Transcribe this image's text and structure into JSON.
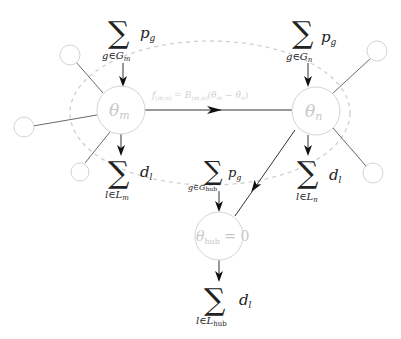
{
  "diagram": {
    "type": "power-network-dc-flow",
    "nodes": {
      "m": {
        "label_base": "θ",
        "label_sub": "m"
      },
      "n": {
        "label_base": "θ",
        "label_sub": "n"
      },
      "hub": {
        "label": "θ",
        "label_sub": "hub",
        "label_suffix": " = 0"
      }
    },
    "edge_mn": {
      "flow_label": "f(m,n) = B(m,n)(θm − θn)",
      "parts": {
        "f": "f",
        "f_sub": "(m,n)",
        "eq": " = ",
        "B": "B",
        "B_sub": "(m,n)",
        "open": "(θ",
        "m": "m",
        "minus": " − θ",
        "n": "n",
        "close": ")"
      }
    },
    "sums": {
      "gen_m": {
        "symbol": "∑",
        "term": "p",
        "term_sub": "g",
        "index": "g∈G",
        "index_sub": "m"
      },
      "gen_n": {
        "symbol": "∑",
        "term": "p",
        "term_sub": "g",
        "index": "g∈G",
        "index_sub": "n"
      },
      "gen_hub": {
        "symbol": "∑",
        "term": "p",
        "term_sub": "g",
        "index": "g∈G",
        "index_sub": "hub"
      },
      "load_m": {
        "symbol": "∑",
        "term": "d",
        "term_sub": "l",
        "index": "l∈L",
        "index_sub": "m"
      },
      "load_n": {
        "symbol": "∑",
        "term": "d",
        "term_sub": "l",
        "index": "l∈L",
        "index_sub": "n"
      },
      "load_hub": {
        "symbol": "∑",
        "term": "d",
        "term_sub": "l",
        "index": "l∈L",
        "index_sub": "hub"
      }
    },
    "colors": {
      "node_stroke": "#d4d4d4",
      "node_label": "#c8c8c8",
      "edge": "#333333",
      "dashed_region": "#d0d0d0",
      "text": "#222222"
    }
  }
}
